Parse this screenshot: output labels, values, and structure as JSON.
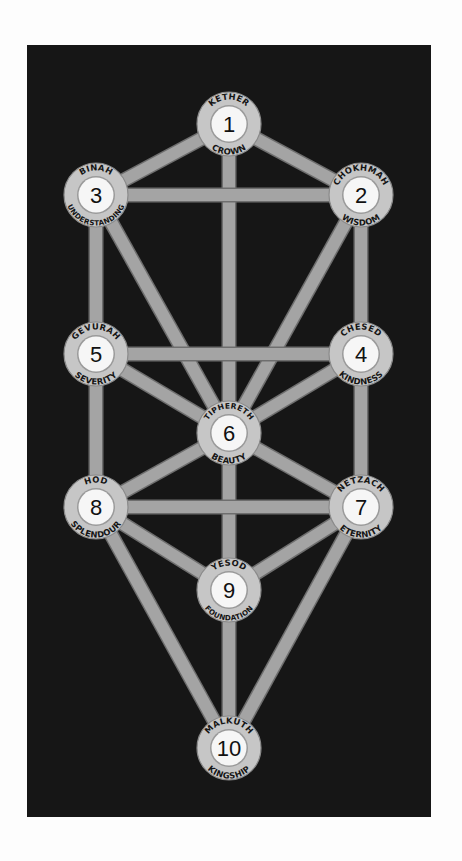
{
  "diagram": {
    "type": "tree-of-life",
    "background": {
      "x": 27,
      "y": 45,
      "width": 404,
      "height": 772,
      "color": "#161616"
    },
    "colors": {
      "page": "#fdfdfd",
      "panel": "#161616",
      "path": "#a4a4a4",
      "path_edge": "#6e6e6e",
      "ring": "#c6c6c6",
      "ring_edge": "#8a8a8a",
      "inner": "#f6f6f6",
      "text": "#151515"
    },
    "sefirot": [
      {
        "number": "1",
        "name": "KETHER",
        "meaning": "CROWN",
        "cx": 229,
        "cy": 124
      },
      {
        "number": "2",
        "name": "CHOKHMAH",
        "meaning": "WISDOM",
        "cx": 361,
        "cy": 195
      },
      {
        "number": "3",
        "name": "BINAH",
        "meaning": "UNDERSTANDING",
        "cx": 96,
        "cy": 195
      },
      {
        "number": "4",
        "name": "CHESED",
        "meaning": "KINDNESS",
        "cx": 361,
        "cy": 354
      },
      {
        "number": "5",
        "name": "GEVURAH",
        "meaning": "SEVERITY",
        "cx": 96,
        "cy": 354
      },
      {
        "number": "6",
        "name": "TIPHERETH",
        "meaning": "BEAUTY",
        "cx": 229,
        "cy": 433
      },
      {
        "number": "7",
        "name": "NETZACH",
        "meaning": "ETERNITY",
        "cx": 361,
        "cy": 507
      },
      {
        "number": "8",
        "name": "HOD",
        "meaning": "SPLENDOUR",
        "cx": 96,
        "cy": 507
      },
      {
        "number": "9",
        "name": "YESOD",
        "meaning": "FOUNDATION",
        "cx": 229,
        "cy": 590
      },
      {
        "number": "10",
        "name": "MALKUTH",
        "meaning": "KINGSHIP",
        "cx": 229,
        "cy": 748
      }
    ],
    "paths": [
      [
        "1",
        "2"
      ],
      [
        "1",
        "3"
      ],
      [
        "1",
        "6"
      ],
      [
        "2",
        "3"
      ],
      [
        "2",
        "4"
      ],
      [
        "2",
        "6"
      ],
      [
        "3",
        "5"
      ],
      [
        "3",
        "6"
      ],
      [
        "4",
        "5"
      ],
      [
        "4",
        "6"
      ],
      [
        "4",
        "7"
      ],
      [
        "5",
        "6"
      ],
      [
        "5",
        "8"
      ],
      [
        "6",
        "7"
      ],
      [
        "6",
        "8"
      ],
      [
        "6",
        "9"
      ],
      [
        "7",
        "8"
      ],
      [
        "7",
        "9"
      ],
      [
        "7",
        "10"
      ],
      [
        "8",
        "9"
      ],
      [
        "8",
        "10"
      ],
      [
        "9",
        "10"
      ]
    ]
  }
}
